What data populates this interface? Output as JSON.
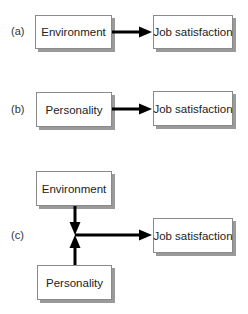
{
  "diagrams": [
    {
      "label": "(a)",
      "source": "Environment",
      "target": "Job satisfaction"
    },
    {
      "label": "(b)",
      "source": "Personality",
      "target": "Job satisfaction"
    },
    {
      "label": "(c)",
      "sources": [
        "Environment",
        "Personality"
      ],
      "target": "Job satisfaction"
    }
  ],
  "colors": {
    "arrow": "#000000",
    "box_border": "#8a8a8a",
    "shadow": "#9a9a9a",
    "text": "#222222"
  }
}
